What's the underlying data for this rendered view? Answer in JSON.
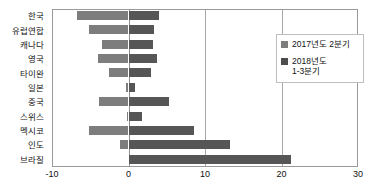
{
  "chart_data": {
    "type": "bar",
    "orientation": "horizontal",
    "title": "",
    "xlabel": "",
    "ylabel": "",
    "xlim": [
      -10,
      30
    ],
    "xticks": [
      -10,
      0,
      10,
      20,
      30
    ],
    "xtick_labels": [
      "-10",
      "0",
      "10",
      "20",
      "30"
    ],
    "grid": true,
    "grid_axis": "x",
    "legend_position": "right-top",
    "categories": [
      "한국",
      "유럽연합",
      "캐나다",
      "영국",
      "타이완",
      "일본",
      "중국",
      "스위스",
      "멕시코",
      "인도",
      "브라질"
    ],
    "series": [
      {
        "name": "2017년도 2분기",
        "color": "#7d7d7d",
        "values": [
          -6.7,
          -5.1,
          -3.5,
          -4.0,
          -2.6,
          -0.3,
          -3.9,
          -0.2,
          -5.1,
          -1.1,
          0.0
        ]
      },
      {
        "name": "2018년도\n1-3분기",
        "color": "#565656",
        "values": [
          4.0,
          3.3,
          3.2,
          3.7,
          2.9,
          0.9,
          5.3,
          1.8,
          8.5,
          13.3,
          21.2
        ]
      }
    ]
  },
  "legend": {
    "items": [
      {
        "label": "2017년도 2분기",
        "swatch": "prev"
      },
      {
        "label": "2018년도\n1-3분기",
        "swatch": "curr"
      }
    ]
  },
  "colors": {
    "series_prev": "#7d7d7d",
    "series_curr": "#565656",
    "axis": "#9a9a9a",
    "grid": "#a8a8a8",
    "background": "#ffffff",
    "text": "#111111"
  }
}
